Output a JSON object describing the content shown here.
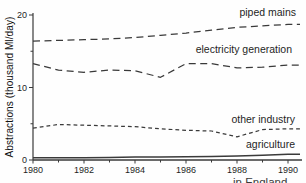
{
  "chart_data": {
    "type": "line",
    "title": "",
    "ylabel": "Abstractions (thousand Ml/day)",
    "xlabel": "",
    "x": [
      1980,
      1981,
      1982,
      1983,
      1984,
      1985,
      1986,
      1987,
      1988,
      1989,
      1990
    ],
    "x_major_ticks": [
      1980,
      1982,
      1984,
      1986,
      1988,
      1990
    ],
    "x_minor_ticks": [
      1981,
      1983,
      1985,
      1987,
      1989
    ],
    "x_tick_labels": [
      "1980",
      "1982",
      "1984",
      "1986",
      "1988",
      "1990"
    ],
    "y_major_ticks": [
      0,
      10,
      20
    ],
    "y_tick_labels": [
      "0",
      "10",
      "20"
    ],
    "y_minor_ticks": [
      5,
      15
    ],
    "ylim": [
      0,
      20
    ],
    "xlim": [
      1980,
      1990
    ],
    "grid": false,
    "legend_position": "labels-inline-right",
    "line_color": "#3a3a3a",
    "series": [
      {
        "name": "piped mains",
        "style": "dashed-long",
        "values": [
          16.4,
          16.5,
          16.6,
          16.7,
          16.9,
          17.2,
          17.5,
          17.9,
          18.3,
          18.5,
          18.7
        ]
      },
      {
        "name": "electricity generation",
        "style": "dashed-long",
        "values": [
          13.3,
          12.4,
          12.1,
          12.4,
          12.3,
          11.4,
          13.3,
          13.3,
          12.7,
          12.8,
          13.1
        ]
      },
      {
        "name": "other industry",
        "style": "dashed-short",
        "values": [
          4.4,
          4.9,
          4.8,
          4.7,
          4.6,
          4.3,
          4.1,
          4.0,
          3.2,
          4.2,
          4.3
        ]
      },
      {
        "name": "agriculture",
        "style": "solid",
        "values": [
          0.3,
          0.3,
          0.3,
          0.35,
          0.4,
          0.4,
          0.45,
          0.5,
          0.55,
          0.65,
          0.8
        ]
      }
    ]
  },
  "caption_fragment": "in England"
}
